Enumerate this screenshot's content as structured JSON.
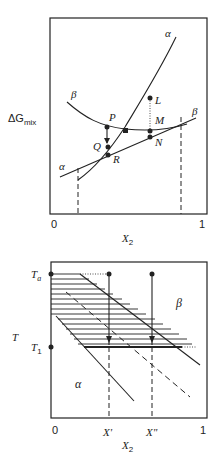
{
  "top_plot": {
    "ylabel_main": "ΔG",
    "ylabel_sub": "mix",
    "xlabel_main": "X",
    "xlabel_sub": "2",
    "x_ticks": [
      "0",
      "1"
    ],
    "curve_labels": {
      "alpha_top": "α",
      "beta_left": "β",
      "alpha_left": "α",
      "beta_right": "β"
    },
    "points": [
      "P",
      "Q",
      "R",
      "L",
      "M",
      "N"
    ]
  },
  "bottom_plot": {
    "ylabel": "T",
    "y_ticks": {
      "Ta_main": "T",
      "Ta_sub": "a",
      "T1_main": "T",
      "T1_sub": "1"
    },
    "xlabel_main": "X",
    "xlabel_sub": "2",
    "x_ticks": [
      "0",
      "1"
    ],
    "x_marks": [
      "X'",
      "X\""
    ],
    "region_labels": {
      "alpha": "α",
      "beta": "β"
    }
  },
  "colors": {
    "ink": "#222222",
    "background": "#ffffff"
  }
}
